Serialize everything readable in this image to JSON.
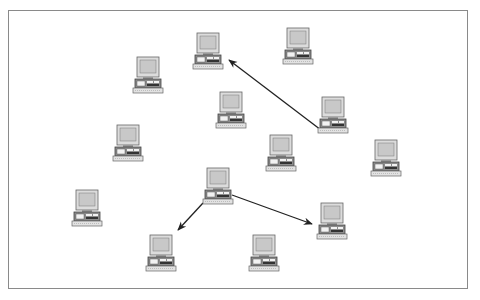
{
  "diagram": {
    "type": "network",
    "node_icon": "desktop-computer-icon",
    "colors": {
      "frame": "#8a8a8a",
      "monitor_bezel": "#dcdcdc",
      "screen": "#c4c4c4",
      "outline": "#555555",
      "base": "#9a9a9a",
      "keyboard": "#e2e2e2",
      "arrow": "#222222"
    },
    "nodes": [
      {
        "id": "pc-1",
        "label": ""
      },
      {
        "id": "pc-2",
        "label": ""
      },
      {
        "id": "pc-3",
        "label": ""
      },
      {
        "id": "pc-4",
        "label": ""
      },
      {
        "id": "pc-5",
        "label": ""
      },
      {
        "id": "pc-6",
        "label": ""
      },
      {
        "id": "pc-7",
        "label": ""
      },
      {
        "id": "pc-8",
        "label": ""
      },
      {
        "id": "pc-9",
        "label": ""
      },
      {
        "id": "pc-10",
        "label": ""
      },
      {
        "id": "pc-11",
        "label": ""
      },
      {
        "id": "pc-12",
        "label": ""
      },
      {
        "id": "pc-13",
        "label": ""
      }
    ],
    "edges": [
      {
        "from": "pc-5",
        "to": "pc-1",
        "directed": true
      },
      {
        "from": "pc-9",
        "to": "pc-12",
        "directed": true
      },
      {
        "from": "pc-9",
        "to": "pc-11",
        "directed": true
      }
    ]
  }
}
